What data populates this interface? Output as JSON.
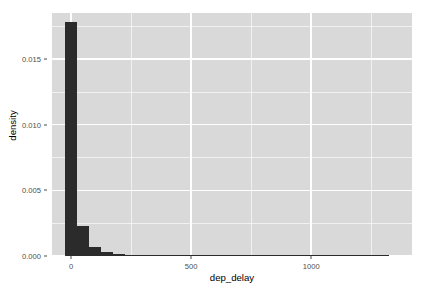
{
  "chart_data": {
    "type": "bar",
    "title": "",
    "subtitle": "",
    "xlabel": "dep_delay",
    "ylabel": "density",
    "grid": true,
    "legend": null,
    "legend_position": "none",
    "bar_color": "#2b2b2b",
    "panel_background": "#d9d9d9",
    "gridline_color": "#ffffff",
    "page_background": "#ffffff",
    "axis_text_color": "#4d4d4d",
    "binwidth": 50,
    "xlim": [
      -80,
      1420
    ],
    "ylim": [
      0,
      0.0185
    ],
    "xticks": [
      0,
      500,
      1000
    ],
    "xtick_labels": [
      "0",
      "500",
      "1000"
    ],
    "xticks_minor": [
      250,
      750,
      1250
    ],
    "yticks": [
      0.0,
      0.005,
      0.01,
      0.015
    ],
    "ytick_labels": [
      "0.000",
      "0.005",
      "0.010",
      "0.015"
    ],
    "yticks_minor": [
      0.0025,
      0.0075,
      0.0125,
      0.0175
    ],
    "categories": [
      0,
      50,
      100,
      150,
      200,
      250,
      300,
      350,
      400,
      450,
      500,
      550,
      600,
      650,
      700,
      750,
      800,
      850,
      900,
      950,
      1000,
      1050,
      1100,
      1150,
      1200,
      1250,
      1300
    ],
    "values": [
      0.01785,
      0.00225,
      0.00068,
      0.0003,
      0.00013,
      7e-05,
      4e-05,
      2.5e-05,
      1.8e-05,
      1.2e-05,
      9e-06,
      7e-06,
      5e-06,
      4e-06,
      3.2e-06,
      2.6e-06,
      2.1e-06,
      1.7e-06,
      1.4e-06,
      1.1e-06,
      9e-07,
      7e-07,
      6e-07,
      5e-07,
      4e-07,
      3e-07,
      2e-07
    ]
  }
}
